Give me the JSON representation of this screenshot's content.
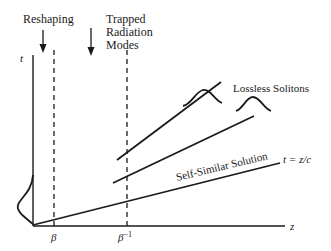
{
  "diagram": {
    "axes": {
      "vertical_label": "t",
      "horizontal_label": "z"
    },
    "top_labels": {
      "reshaping": "Reshaping",
      "trapped_line1": "Trapped",
      "trapped_line2": "Radiation",
      "trapped_line3": "Modes"
    },
    "ticks": {
      "beta": "β",
      "beta_inverse_base": "β",
      "beta_inverse_exp": "−1"
    },
    "curve_labels": {
      "lossless_solitons": "Lossless Solitons",
      "self_similar": "Self-Similar Solution",
      "light_line": "t = z/c"
    },
    "colors": {
      "ink": "#1a1a1a",
      "background": "#ffffff"
    }
  }
}
